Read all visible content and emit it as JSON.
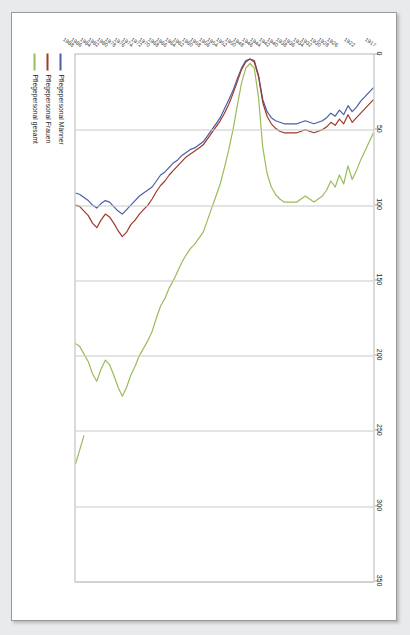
{
  "document": {
    "kind": "scanned-page",
    "page_background": "#e9eaec",
    "sheet_background": "#ffffff",
    "orientation_note": "chart-rotated-90-degrees"
  },
  "chart_data": {
    "type": "line",
    "title": "",
    "subtitle": "",
    "xlabel": "",
    "ylabel": "",
    "orientation": "rotated-90",
    "grid": true,
    "legend_position": "bottom-left",
    "value_axis": {
      "name": "value-axis",
      "position": "top",
      "lim": [
        0,
        350
      ],
      "ticks": [
        0,
        50,
        100,
        150,
        200,
        250,
        300,
        350
      ],
      "tick_labels": [
        "0",
        "50",
        "100",
        "150",
        "200",
        "250",
        "300",
        "350"
      ]
    },
    "category_axis": {
      "name": "year-axis",
      "position": "left",
      "tick_labels": [
        "1917",
        "1922",
        "1926",
        "1928",
        "1930",
        "1932",
        "1934",
        "1936",
        "1938",
        "1940",
        "1942",
        "1944",
        "1946",
        "1948",
        "1950",
        "1952",
        "1954",
        "1956",
        "1958",
        "1960",
        "1962",
        "1964",
        "1966",
        "1968",
        "1970",
        "1972",
        "1974",
        "1976",
        "1978",
        "1980",
        "1982",
        "1984",
        "1986",
        "1988"
      ]
    },
    "categories": [
      1917,
      1918,
      1919,
      1920,
      1921,
      1922,
      1923,
      1924,
      1925,
      1926,
      1927,
      1928,
      1929,
      1930,
      1931,
      1932,
      1933,
      1934,
      1935,
      1936,
      1937,
      1938,
      1939,
      1940,
      1941,
      1942,
      1943,
      1944,
      1945,
      1946,
      1947,
      1948,
      1949,
      1950,
      1951,
      1952,
      1953,
      1954,
      1955,
      1956,
      1957,
      1958,
      1959,
      1960,
      1961,
      1962,
      1963,
      1964,
      1965,
      1966,
      1967,
      1968,
      1969,
      1970,
      1971,
      1972,
      1973,
      1974,
      1975,
      1976,
      1977,
      1978,
      1979,
      1980,
      1981,
      1982,
      1983,
      1984,
      1985,
      1986,
      1987
    ],
    "series": [
      {
        "name": "Pflegepersonal Männer",
        "color": "#4a5fa8",
        "values": [
          22,
          25,
          28,
          31,
          35,
          38,
          34,
          40,
          37,
          41,
          39,
          42,
          44,
          45,
          46,
          45,
          44,
          45,
          46,
          46,
          46,
          46,
          45,
          44,
          42,
          38,
          30,
          14,
          4,
          3,
          4,
          9,
          16,
          24,
          30,
          36,
          42,
          46,
          50,
          54,
          58,
          60,
          62,
          63,
          65,
          67,
          70,
          72,
          75,
          78,
          80,
          84,
          88,
          90,
          92,
          94,
          97,
          100,
          103,
          106,
          104,
          101,
          98,
          97,
          99,
          102,
          100,
          97,
          95,
          93,
          92
        ]
      },
      {
        "name": "Pflegepersonal Frauen",
        "color": "#9e3a28",
        "values": [
          30,
          33,
          36,
          39,
          42,
          45,
          40,
          46,
          43,
          47,
          45,
          48,
          50,
          51,
          52,
          51,
          50,
          51,
          52,
          52,
          52,
          52,
          51,
          49,
          46,
          41,
          32,
          15,
          5,
          3,
          5,
          10,
          18,
          26,
          33,
          39,
          44,
          48,
          52,
          56,
          60,
          62,
          64,
          66,
          68,
          71,
          74,
          77,
          80,
          84,
          87,
          91,
          96,
          100,
          103,
          106,
          110,
          113,
          118,
          121,
          117,
          112,
          108,
          106,
          110,
          115,
          112,
          107,
          104,
          101,
          100
        ]
      },
      {
        "name": "Pflegepersonal gesamt",
        "color": "#9bbb59",
        "values": [
          52,
          58,
          64,
          70,
          77,
          83,
          74,
          86,
          80,
          88,
          84,
          90,
          94,
          96,
          98,
          96,
          94,
          96,
          98,
          98,
          98,
          98,
          96,
          93,
          88,
          79,
          62,
          29,
          9,
          6,
          9,
          19,
          34,
          50,
          63,
          75,
          86,
          94,
          102,
          110,
          118,
          122,
          126,
          129,
          133,
          138,
          144,
          150,
          155,
          162,
          167,
          175,
          184,
          190,
          195,
          200,
          207,
          213,
          221,
          227,
          221,
          213,
          206,
          203,
          209,
          217,
          212,
          204,
          199,
          194,
          192
        ]
      }
    ],
    "series_late_segment": {
      "name": "Pflegepersonal gesamt",
      "color": "#9bbb59",
      "points": [
        {
          "year": 1985,
          "value": 253
        },
        {
          "year": 1987,
          "value": 272
        }
      ]
    },
    "legend": [
      {
        "label": "Pflegepersonal Männer",
        "color": "#4a5fa8"
      },
      {
        "label": "Pflegepersonal Frauen",
        "color": "#9e3a28"
      },
      {
        "label": "Pflegepersonal gesamt",
        "color": "#9bbb59"
      }
    ]
  }
}
